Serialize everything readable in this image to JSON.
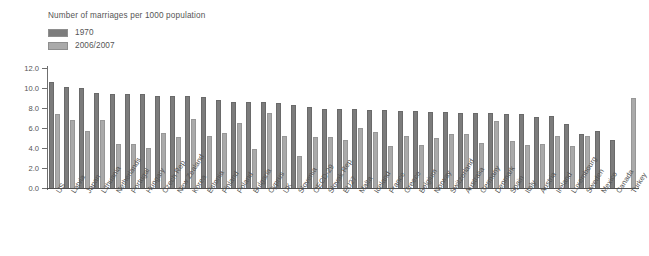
{
  "chart_data": {
    "type": "bar",
    "title": "Number of marriages per 1000 population",
    "xlabel": "",
    "ylabel": "",
    "ylim": [
      0,
      12
    ],
    "ytick_labels": [
      "12.0",
      "10.0",
      "8.0",
      "6.0",
      "4.0",
      "2.0",
      "0.0"
    ],
    "ytick_values": [
      12.0,
      10.0,
      8.0,
      6.0,
      4.0,
      2.0,
      0.0
    ],
    "grid": false,
    "legend_position": "top-left",
    "categories": [
      "US",
      "Latvia",
      "Japan",
      "Lithuania",
      "Netherlands",
      "Portugal",
      "Hungary",
      "Czech Rep.",
      "New Zealand",
      "Korea",
      "Estonia",
      "Finland",
      "Poland",
      "Bulgaria",
      "Cyprus",
      "UK",
      "Slovenia",
      "OECD-29",
      "Slovak Rep.",
      "EU27",
      "Malta",
      "Iceland",
      "France",
      "Greece",
      "Belgium",
      "Norway",
      "Switzerland",
      "Australia",
      "Germany",
      "Denmark",
      "Spain",
      "Italy",
      "Austria",
      "Ireland",
      "Luxembourg",
      "Sweden",
      "Mexico",
      "Canada",
      "Turkey"
    ],
    "series": [
      {
        "name": "1970",
        "color": "#7c7c7c",
        "values": [
          10.6,
          10.1,
          10.0,
          9.5,
          9.4,
          9.4,
          9.4,
          9.2,
          9.2,
          9.2,
          9.1,
          8.8,
          8.6,
          8.6,
          8.6,
          8.5,
          8.3,
          8.1,
          7.9,
          7.9,
          7.9,
          7.8,
          7.8,
          7.7,
          7.7,
          7.6,
          7.6,
          7.5,
          7.5,
          7.5,
          7.4,
          7.4,
          7.1,
          7.2,
          6.4,
          5.4,
          5.7,
          4.8,
          null
        ]
      },
      {
        "name": "2006/2007",
        "color": "#aaaaaa",
        "values": [
          7.4,
          6.8,
          5.7,
          6.8,
          4.4,
          4.4,
          4.0,
          5.5,
          5.1,
          6.9,
          5.2,
          5.5,
          6.5,
          3.9,
          7.5,
          5.2,
          3.2,
          5.1,
          5.1,
          4.8,
          6.0,
          5.6,
          4.2,
          5.2,
          4.3,
          5.0,
          5.4,
          5.4,
          4.5,
          6.7,
          4.7,
          4.3,
          4.4,
          5.2,
          4.2,
          5.2,
          null,
          null,
          9.0
        ]
      }
    ]
  }
}
